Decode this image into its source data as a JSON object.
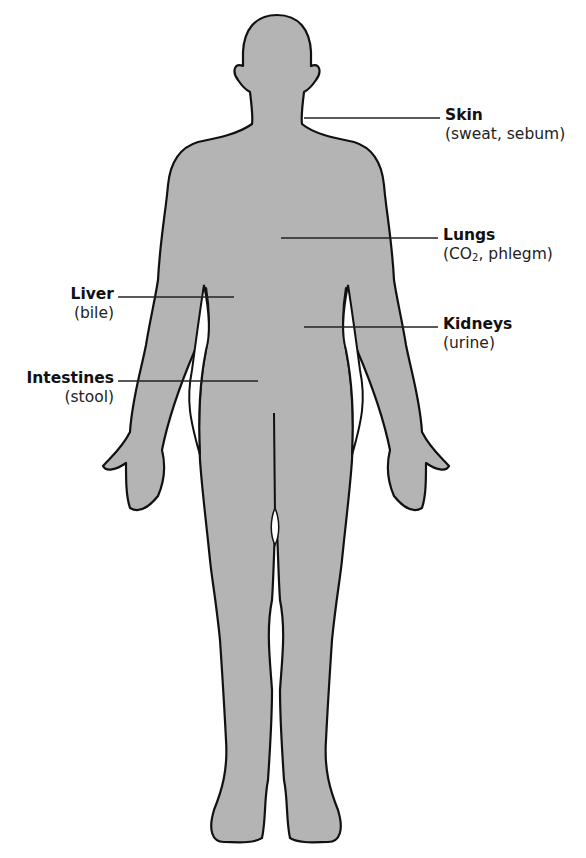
{
  "diagram": {
    "fill_color": "#b4b4b4",
    "outline_color": "#111111",
    "labels": [
      {
        "id": "skin",
        "name": "Skin",
        "detail": "(sweat, sebum)",
        "side": "right"
      },
      {
        "id": "lungs",
        "name": "Lungs",
        "detail_prefix": "(CO",
        "detail_sub": "2",
        "detail_suffix": ", phlegm)",
        "side": "right"
      },
      {
        "id": "kidneys",
        "name": "Kidneys",
        "detail": "(urine)",
        "side": "right"
      },
      {
        "id": "liver",
        "name": "Liver",
        "detail": "(bile)",
        "side": "left"
      },
      {
        "id": "intestines",
        "name": "Intestines",
        "detail": "(stool)",
        "side": "left"
      }
    ]
  }
}
